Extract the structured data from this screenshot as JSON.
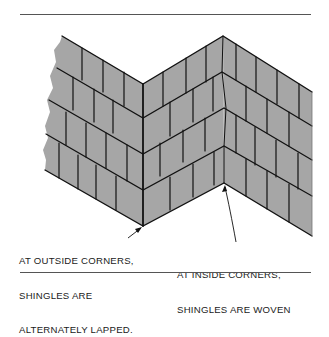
{
  "figure": {
    "colors": {
      "shingle_fill": "#a6a6a6",
      "line": "#111111",
      "rule": "#555555",
      "background": "#ffffff"
    }
  },
  "labels": {
    "outside_corner": {
      "lines": [
        "AT OUTSIDE CORNERS,",
        "SHINGLES ARE",
        "ALTERNATELY LAPPED."
      ]
    },
    "inside_corner": {
      "lines": [
        "AT INSIDE CORNERS,",
        "SHINGLES ARE WOVEN"
      ]
    }
  }
}
